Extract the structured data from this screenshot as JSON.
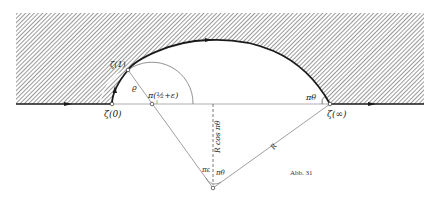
{
  "figure": {
    "caption": "Abb. 31",
    "colors": {
      "ink": "#1a1a1a",
      "thin": "#777777",
      "hatch": "#5a5a5a",
      "background": "#ffffff"
    }
  },
  "labels": {
    "zeta0": "ζ(0)",
    "zeta1": "ζ(1)",
    "zetaInf": "ζ(∞)",
    "rho": "ϱ",
    "angle_small": "π(½+ε)",
    "angle_theta_top": "πθ",
    "R_cos": "R cos πθ",
    "R": "R",
    "angle_eps": "πε",
    "angle_theta_bottom": "πθ"
  }
}
